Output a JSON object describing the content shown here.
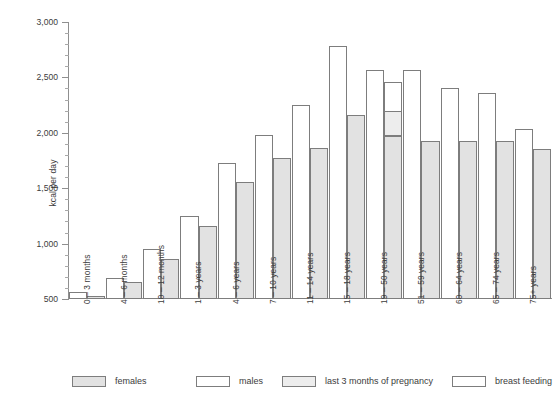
{
  "chart_data": {
    "type": "bar",
    "title": "",
    "subtitle": "",
    "xlabel": "",
    "ylabel": "kcal per day",
    "ylim": [
      500,
      3000
    ],
    "ytick_step": 500,
    "yminor_step": 100,
    "grid": false,
    "legend_position": "bottom",
    "ytick_labels": [
      "3,000",
      "2,500",
      "2,000",
      "1,500",
      "1,000",
      "500"
    ],
    "ytick_values": [
      3000,
      2500,
      2000,
      1500,
      1000,
      500
    ],
    "categories": [
      "0 – 3 months",
      "4 – 6 months",
      "10 – 12 months",
      "1 – 3 years",
      "4 – 6 years",
      "7 – 10 years",
      "11 – 14 years",
      "15 – 18 years",
      "19 – 50 years",
      "51 – 59 years",
      "60 – 64 years",
      "65 – 74 years",
      "75+ years"
    ],
    "series": [
      {
        "name": "males",
        "color": "#ffffff",
        "values": [
          560,
          690,
          950,
          1250,
          1730,
          1980,
          2250,
          2780,
          2570,
          2570,
          2400,
          2360,
          2030
        ]
      },
      {
        "name": "females",
        "color": "#e2e2e2",
        "values": [
          530,
          650,
          860,
          1160,
          1560,
          1770,
          1860,
          2160,
          1970,
          1930,
          1930,
          1930,
          1850
        ]
      },
      {
        "name": "last 3 months of pregnancy",
        "color": "#ededed",
        "stacked_on": "females",
        "values": [
          null,
          null,
          null,
          null,
          null,
          null,
          null,
          null,
          2190,
          null,
          null,
          null,
          null
        ]
      },
      {
        "name": "breast feeding",
        "color": "#ffffff",
        "stacked_on": "females",
        "values": [
          null,
          null,
          null,
          null,
          null,
          null,
          null,
          null,
          2450,
          null,
          null,
          null,
          null
        ]
      }
    ],
    "legend": [
      {
        "label": "females",
        "swatch": "females"
      },
      {
        "label": "males",
        "swatch": "males"
      },
      {
        "label": "last 3 months of pregnancy",
        "swatch": "pregnancy"
      },
      {
        "label": "breast feeding",
        "swatch": "breast"
      }
    ],
    "colors": {
      "female_fill": "#e2e2e2",
      "male_fill": "#ffffff",
      "pregnancy_fill": "#ededed",
      "breast_fill": "#ffffff",
      "bar_stroke": "#7d7d7d",
      "axis": "#8f8f8f",
      "text": "#3c3c3c"
    }
  }
}
